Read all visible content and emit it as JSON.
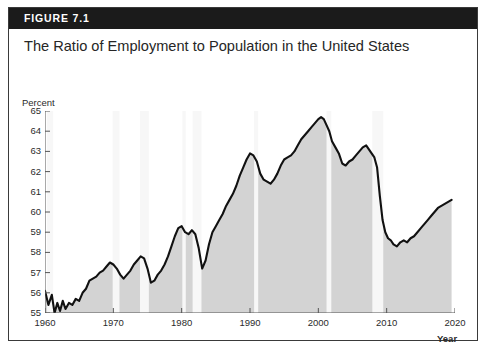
{
  "figure": {
    "header_label": "FIGURE 7.1",
    "title": "The Ratio of Employment to Population in the United States",
    "header_bg": "#1b1b1b",
    "header_text_color": "#ffffff",
    "border_color": "#3a3a3a"
  },
  "chart_data": {
    "type": "area",
    "title": "The Ratio of Employment to Population in the United States",
    "xlabel": "Year",
    "ylabel": "Percent",
    "xlim": [
      1960,
      2020
    ],
    "ylim": [
      55,
      65
    ],
    "grid": false,
    "legend": null,
    "line_color": "#111111",
    "fill_color": "#d3d3d3",
    "recession_band_color": "#f7f7f7",
    "xticks": [
      1960,
      1970,
      1980,
      1990,
      2000,
      2010,
      2020
    ],
    "xtick_labels": [
      "1960",
      "1970",
      "1980",
      "1990",
      "2000",
      "2010",
      "2020"
    ],
    "yticks": [
      55,
      56,
      57,
      58,
      59,
      60,
      61,
      62,
      63,
      64,
      65
    ],
    "ytick_labels": [
      "55",
      "56",
      "57",
      "58",
      "59",
      "60",
      "61",
      "62",
      "63",
      "64",
      "65"
    ],
    "series": [
      {
        "name": "Employment-to-Population Ratio",
        "x": [
          1960.0,
          1960.5,
          1961.0,
          1961.4,
          1961.8,
          1962.2,
          1962.6,
          1963.0,
          1963.5,
          1964.0,
          1964.5,
          1965.0,
          1965.5,
          1966.0,
          1966.5,
          1967.0,
          1967.5,
          1968.0,
          1968.5,
          1969.0,
          1969.5,
          1970.0,
          1970.5,
          1971.0,
          1971.5,
          1972.0,
          1972.5,
          1973.0,
          1973.5,
          1974.0,
          1974.5,
          1975.0,
          1975.5,
          1976.0,
          1976.5,
          1977.0,
          1977.5,
          1978.0,
          1978.5,
          1979.0,
          1979.5,
          1980.0,
          1980.5,
          1981.0,
          1981.5,
          1982.0,
          1982.5,
          1983.0,
          1983.5,
          1984.0,
          1984.5,
          1985.0,
          1985.5,
          1986.0,
          1986.5,
          1987.0,
          1987.5,
          1988.0,
          1988.5,
          1989.0,
          1989.5,
          1990.0,
          1990.5,
          1991.0,
          1991.5,
          1992.0,
          1992.5,
          1993.0,
          1993.5,
          1994.0,
          1994.5,
          1995.0,
          1995.5,
          1996.0,
          1996.5,
          1997.0,
          1997.5,
          1998.0,
          1998.5,
          1999.0,
          1999.5,
          2000.0,
          2000.4,
          2000.8,
          2001.2,
          2001.6,
          2002.0,
          2002.5,
          2003.0,
          2003.5,
          2004.0,
          2004.5,
          2005.0,
          2005.5,
          2006.0,
          2006.5,
          2007.0,
          2007.4,
          2007.8,
          2008.2,
          2008.6,
          2009.0,
          2009.4,
          2009.8,
          2010.2,
          2010.6,
          2011.0,
          2011.5,
          2012.0,
          2012.5,
          2013.0,
          2013.5,
          2014.0,
          2014.5,
          2015.0,
          2015.5,
          2016.0,
          2016.5,
          2017.0,
          2017.5,
          2018.0,
          2018.5,
          2019.0,
          2019.5
        ],
        "y": [
          56.1,
          55.4,
          55.9,
          55.0,
          55.5,
          55.1,
          55.6,
          55.2,
          55.5,
          55.4,
          55.7,
          55.6,
          56.0,
          56.2,
          56.6,
          56.7,
          56.8,
          57.0,
          57.1,
          57.3,
          57.5,
          57.4,
          57.2,
          56.9,
          56.7,
          56.9,
          57.1,
          57.4,
          57.6,
          57.8,
          57.7,
          57.2,
          56.5,
          56.6,
          56.9,
          57.1,
          57.4,
          57.8,
          58.3,
          58.8,
          59.2,
          59.3,
          59.0,
          58.9,
          59.1,
          58.9,
          58.2,
          57.2,
          57.6,
          58.4,
          59.0,
          59.3,
          59.6,
          59.9,
          60.3,
          60.6,
          60.9,
          61.3,
          61.8,
          62.2,
          62.6,
          62.9,
          62.8,
          62.5,
          61.9,
          61.6,
          61.5,
          61.4,
          61.6,
          61.9,
          62.3,
          62.6,
          62.7,
          62.8,
          63.0,
          63.3,
          63.6,
          63.8,
          64.0,
          64.2,
          64.4,
          64.6,
          64.7,
          64.6,
          64.3,
          64.0,
          63.5,
          63.2,
          62.9,
          62.4,
          62.3,
          62.5,
          62.6,
          62.8,
          63.0,
          63.2,
          63.3,
          63.1,
          62.9,
          62.7,
          62.2,
          60.8,
          59.6,
          59.0,
          58.7,
          58.6,
          58.4,
          58.3,
          58.5,
          58.6,
          58.5,
          58.7,
          58.8,
          59.0,
          59.2,
          59.4,
          59.6,
          59.8,
          60.0,
          60.2,
          60.3,
          60.4,
          60.5,
          60.6
        ]
      }
    ],
    "recession_bands": [
      {
        "start": 1960.3,
        "end": 1961.2
      },
      {
        "start": 1969.9,
        "end": 1970.9
      },
      {
        "start": 1973.9,
        "end": 1975.2
      },
      {
        "start": 1980.1,
        "end": 1980.6
      },
      {
        "start": 1981.6,
        "end": 1982.9
      },
      {
        "start": 1990.6,
        "end": 1991.2
      },
      {
        "start": 2001.2,
        "end": 2001.9
      },
      {
        "start": 2007.9,
        "end": 2009.5
      }
    ]
  }
}
